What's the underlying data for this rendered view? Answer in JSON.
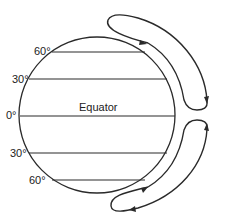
{
  "diagram": {
    "labels": {
      "lat_60_north": "60°",
      "lat_30_north": "30°",
      "lat_0": "0°",
      "lat_30_south": "30°",
      "lat_60_south": "60°",
      "equator": "Equator"
    },
    "colors": {
      "stroke": "#2a2a2a",
      "background": "#ffffff"
    }
  }
}
